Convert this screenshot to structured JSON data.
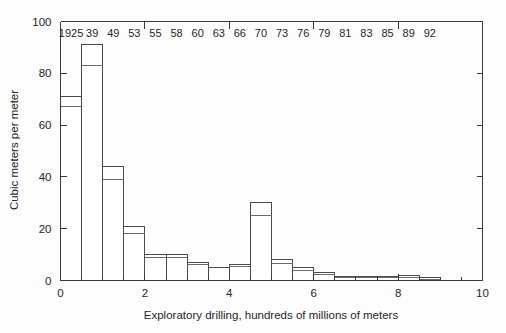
{
  "chart_data": {
    "type": "bar",
    "title": "",
    "subtitle": "",
    "xlabel": "Exploratory drilling, hundreds of millions of meters",
    "ylabel": "Cubic meters per meter",
    "xlim": [
      0,
      10
    ],
    "ylim": [
      0,
      100
    ],
    "xticks": [
      0,
      2,
      4,
      6,
      8,
      10
    ],
    "yticks": [
      0,
      20,
      40,
      60,
      80,
      100
    ],
    "xtick_labels": [
      "0",
      "2",
      "4",
      "6",
      "8",
      "10"
    ],
    "ytick_labels": [
      "0",
      "20",
      "40",
      "60",
      "80",
      "100"
    ],
    "minor_xticks": [
      0.5,
      1,
      1.5,
      2.5,
      3,
      3.5,
      4.5,
      5,
      5.5,
      6.5,
      7,
      7.5,
      8.5,
      9,
      9.5
    ],
    "grid": false,
    "legend": null,
    "legend_position": "none",
    "annotation_note": "Year labels printed across the top of the plot, one per bar",
    "bar_top_labels": [
      "1925",
      "39",
      "49",
      "53",
      "55",
      "58",
      "60",
      "63",
      "66",
      "70",
      "73",
      "76",
      "79",
      "81",
      "83",
      "85",
      "89",
      "92"
    ],
    "series": [
      {
        "name": "upper value",
        "values": [
          71,
          91,
          44,
          21,
          10,
          10,
          7,
          5,
          6,
          30,
          8,
          5,
          3,
          1.5,
          1.5,
          1.5,
          2,
          1
        ]
      },
      {
        "name": "lower value",
        "values": [
          67,
          83,
          39,
          18,
          9,
          9,
          6,
          5,
          5.5,
          25,
          6.5,
          4,
          2.5,
          1,
          1,
          1,
          1,
          0.5
        ]
      }
    ],
    "bars": [
      {
        "label": "1925",
        "x_start": 0.0,
        "x_end": 0.5,
        "upper": 71,
        "lower": 67
      },
      {
        "label": "39",
        "x_start": 0.5,
        "x_end": 1.0,
        "upper": 91,
        "lower": 83
      },
      {
        "label": "49",
        "x_start": 1.0,
        "x_end": 1.5,
        "upper": 44,
        "lower": 39
      },
      {
        "label": "53",
        "x_start": 1.5,
        "x_end": 2.0,
        "upper": 21,
        "lower": 18
      },
      {
        "label": "55",
        "x_start": 2.0,
        "x_end": 2.5,
        "upper": 10,
        "lower": 9
      },
      {
        "label": "58",
        "x_start": 2.5,
        "x_end": 3.0,
        "upper": 10,
        "lower": 9
      },
      {
        "label": "60",
        "x_start": 3.0,
        "x_end": 3.5,
        "upper": 7,
        "lower": 6
      },
      {
        "label": "63",
        "x_start": 3.5,
        "x_end": 4.0,
        "upper": 5,
        "lower": 5
      },
      {
        "label": "66",
        "x_start": 4.0,
        "x_end": 4.5,
        "upper": 6,
        "lower": 5.5
      },
      {
        "label": "70",
        "x_start": 4.5,
        "x_end": 5.0,
        "upper": 30,
        "lower": 25
      },
      {
        "label": "73",
        "x_start": 5.0,
        "x_end": 5.5,
        "upper": 8,
        "lower": 6.5
      },
      {
        "label": "76",
        "x_start": 5.5,
        "x_end": 6.0,
        "upper": 5,
        "lower": 4
      },
      {
        "label": "79",
        "x_start": 6.0,
        "x_end": 6.5,
        "upper": 3,
        "lower": 2.5
      },
      {
        "label": "81",
        "x_start": 6.5,
        "x_end": 7.0,
        "upper": 1.5,
        "lower": 1
      },
      {
        "label": "83",
        "x_start": 7.0,
        "x_end": 7.5,
        "upper": 1.5,
        "lower": 1
      },
      {
        "label": "85",
        "x_start": 7.5,
        "x_end": 8.0,
        "upper": 1.5,
        "lower": 1
      },
      {
        "label": "89",
        "x_start": 8.0,
        "x_end": 8.5,
        "upper": 2,
        "lower": 1
      },
      {
        "label": "92",
        "x_start": 8.5,
        "x_end": 9.0,
        "upper": 1,
        "lower": 0.5
      }
    ]
  },
  "colors": {
    "background": "#fdfdfd",
    "axis": "#3a3a3a",
    "bar_stroke": "#4a4a4a",
    "bar_fill": "#ffffff",
    "text": "#262626"
  }
}
